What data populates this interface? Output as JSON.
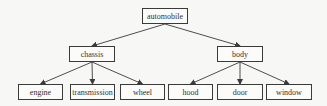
{
  "diagram": {
    "type": "tree",
    "root": "automobile",
    "nodes": {
      "automobile": {
        "label": "automobile",
        "x": 142,
        "y": 8,
        "w": 46,
        "h": 16
      },
      "chassis": {
        "label": "chassis",
        "x": 69,
        "y": 46,
        "w": 46,
        "h": 16
      },
      "body": {
        "label": "body",
        "x": 217,
        "y": 46,
        "w": 46,
        "h": 16
      },
      "engine": {
        "label": "engine",
        "x": 18,
        "y": 84,
        "w": 45,
        "h": 16
      },
      "transmission": {
        "label": "transmission",
        "x": 70,
        "y": 84,
        "w": 45,
        "h": 16
      },
      "wheel": {
        "label": "wheel",
        "x": 120,
        "y": 84,
        "w": 45,
        "h": 16
      },
      "hood": {
        "label": "hood",
        "x": 168,
        "y": 84,
        "w": 45,
        "h": 16
      },
      "door": {
        "label": "door",
        "x": 217,
        "y": 84,
        "w": 46,
        "h": 16
      },
      "window": {
        "label": "window",
        "x": 266,
        "y": 84,
        "w": 46,
        "h": 16
      }
    },
    "edges": [
      {
        "from": "automobile",
        "to": "chassis"
      },
      {
        "from": "automobile",
        "to": "body"
      },
      {
        "from": "chassis",
        "to": "engine"
      },
      {
        "from": "chassis",
        "to": "transmission"
      },
      {
        "from": "chassis",
        "to": "wheel"
      },
      {
        "from": "body",
        "to": "hood"
      },
      {
        "from": "body",
        "to": "door"
      },
      {
        "from": "body",
        "to": "window"
      }
    ],
    "colors": {
      "line": "#3a3a3a",
      "border": "#3a3a3a",
      "text": "#333333"
    }
  }
}
